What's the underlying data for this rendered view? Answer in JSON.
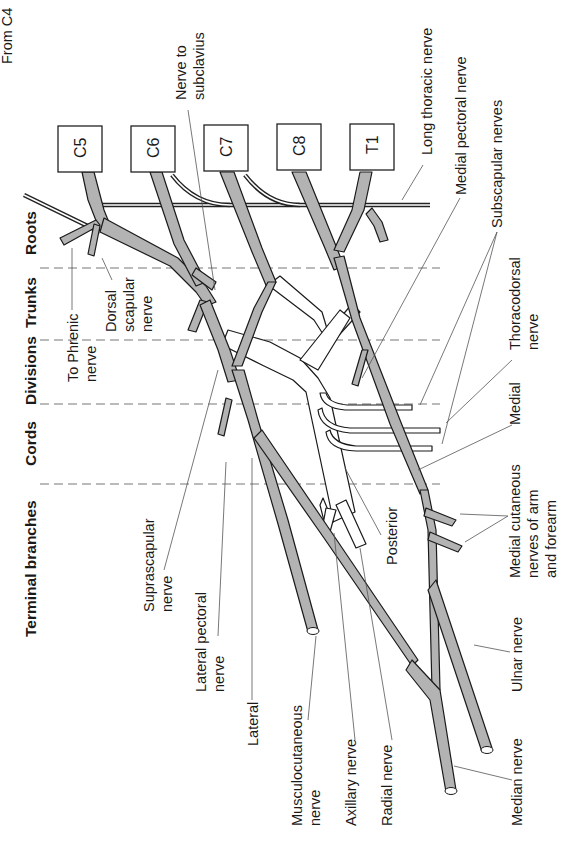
{
  "regions": [
    {
      "label": "Roots"
    },
    {
      "label": "Trunks"
    },
    {
      "label": "Divisions"
    },
    {
      "label": "Cords"
    },
    {
      "label": "Terminal branches"
    }
  ],
  "roots": [
    "C5",
    "C6",
    "C7",
    "C8",
    "T1"
  ],
  "labels": {
    "from_c4": "From C4",
    "nerve_to_subclavius_1": "Nerve to",
    "nerve_to_subclavius_2": "subclavius",
    "long_thoracic": "Long thoracic nerve",
    "medial_pectoral": "Medial pectoral nerve",
    "subscapular": "Subscapular nerves",
    "thoracodorsal_1": "Thoracodorsal",
    "thoracodorsal_2": "nerve",
    "medial": "Medial",
    "medial_cut_1": "Medial cutaneous",
    "medial_cut_2": "nerves of arm",
    "medial_cut_3": "and forearm",
    "ulnar": "Ulnar nerve",
    "median": "Median nerve",
    "radial": "Radial nerve",
    "axillary": "Axillary nerve",
    "musculo_1": "Musculocutaneous",
    "musculo_2": "nerve",
    "lateral": "Lateral",
    "lat_pect_1": "Lateral pectoral",
    "lat_pect_2": "nerve",
    "suprascap_1": "Suprascapular",
    "suprascap_2": "nerve",
    "posterior": "Posterior",
    "to_phrenic_1": "To Phrenic",
    "to_phrenic_2": "nerve",
    "dorsal_scap_1": "Dorsal",
    "dorsal_scap_2": "scapular",
    "dorsal_scap_3": "nerve"
  },
  "colors": {
    "nerve_fill": "#b3b3b3",
    "outline": "#1a1a1a",
    "posterior_fill": "#ffffff"
  }
}
